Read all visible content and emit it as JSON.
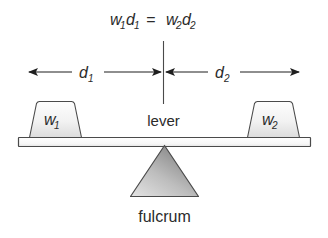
{
  "diagram": {
    "equation": {
      "lhs_var": "w",
      "lhs_sub1": "1",
      "lhs_var2": "d",
      "lhs_sub2": "1",
      "equals": "=",
      "rhs_var": "w",
      "rhs_sub1": "2",
      "rhs_var2": "d",
      "rhs_sub2": "2",
      "full_text": "w1d1 = w2d2"
    },
    "dimensions": [
      {
        "id": "d1",
        "symbol": "d",
        "subscript": "1",
        "side": "left"
      },
      {
        "id": "d2",
        "symbol": "d",
        "subscript": "2",
        "side": "right"
      }
    ],
    "weights": [
      {
        "id": "w1",
        "symbol": "w",
        "subscript": "1",
        "side": "left"
      },
      {
        "id": "w2",
        "symbol": "w",
        "subscript": "2",
        "side": "right"
      }
    ],
    "parts": [
      {
        "id": "lever",
        "label": "lever"
      },
      {
        "id": "fulcrum",
        "label": "fulcrum"
      }
    ],
    "labels": {
      "lever": "lever",
      "fulcrum": "fulcrum"
    },
    "colors": {
      "background": "#ffffff",
      "outline": "#4a4a4a",
      "text": "#2b2b2b",
      "beam_fill": "#fbfbfb",
      "weight_fill_light": "#fafafa",
      "weight_fill_dark": "#d8d8d8",
      "fulcrum_fill_light": "#d9d9d9",
      "fulcrum_fill_dark": "#8c8c8c",
      "arrow": "#1f1f1f"
    }
  }
}
